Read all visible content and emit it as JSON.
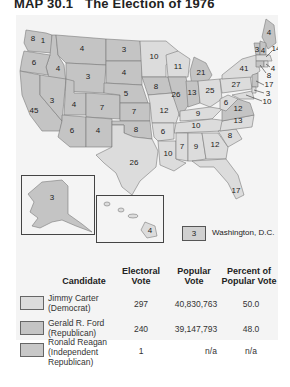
{
  "title": {
    "number": "MAP 30.1",
    "text": "The Election of 1976"
  },
  "colors": {
    "carter": "#dcdcdc",
    "ford": "#c4c4c4",
    "panel_bg": "#f4f4f4",
    "border": "#7a7a7a"
  },
  "states": {
    "WA": "8",
    "ID": "4",
    "MT": "4",
    "ND": "3",
    "MN": "10",
    "OR": "6",
    "WY": "3",
    "SD": "4",
    "WI": "11",
    "MI": "21",
    "NY": "41",
    "NV": "3",
    "UT": "4",
    "CO": "7",
    "NE": "5",
    "IA": "8",
    "IL": "26",
    "IN": "13",
    "OH": "25",
    "PA": "27",
    "CA": "45",
    "KS": "7",
    "MO": "12",
    "KY": "9",
    "WV": "6",
    "VA": "12",
    "AZ": "6",
    "NM": "4",
    "OK": "8",
    "AR": "6",
    "TN": "10",
    "NC": "13",
    "TX": "26",
    "LA": "10",
    "MS": "7",
    "AL": "9",
    "GA": "12",
    "SC": "8",
    "FL": "17",
    "ME": "4",
    "VT": "3",
    "NH": "4",
    "MA": "14",
    "RI": "4",
    "CT": "8",
    "NJ": "17",
    "DE": "3",
    "MD": "10",
    "AK": "3",
    "HI": "4",
    "WA_extra": "1"
  },
  "dc": {
    "votes": "3",
    "label": "Washington, D.C."
  },
  "table": {
    "headers": {
      "candidate": "Candidate",
      "electoral": [
        "Electoral",
        "Vote"
      ],
      "popular": [
        "Popular",
        "Vote"
      ],
      "percent": [
        "Percent of",
        "Popular Vote"
      ]
    },
    "rows": [
      {
        "name": "Jimmy Carter",
        "party": "(Democrat)",
        "electoral": "297",
        "popular": "40,830,763",
        "percent": "50.0"
      },
      {
        "name": "Gerald R. Ford",
        "party": "(Republican)",
        "electoral": "240",
        "popular": "39,147,793",
        "percent": "48.0"
      },
      {
        "name": "Ronald Reagan",
        "party": "(Independent",
        "party2": "Republican)",
        "electoral": "1",
        "popular": "n/a",
        "percent": "n/a"
      }
    ]
  }
}
